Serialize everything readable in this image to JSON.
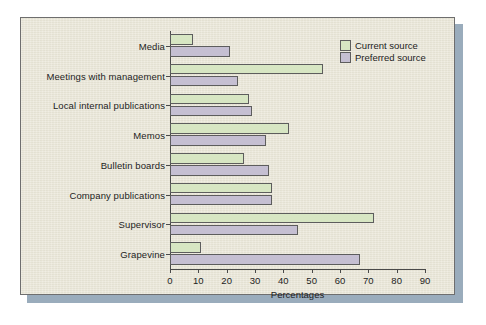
{
  "chart_data": {
    "type": "bar",
    "orientation": "horizontal",
    "title": "",
    "xlabel": "Percentages",
    "ylabel": "",
    "xlim": [
      0,
      90
    ],
    "xticks": [
      0,
      10,
      20,
      30,
      40,
      50,
      60,
      70,
      80,
      90
    ],
    "grid": false,
    "legend_position": "top-right",
    "categories": [
      "Media",
      "Meetings with management",
      "Local internal publications",
      "Memos",
      "Bulletin boards",
      "Company publications",
      "Supervisor",
      "Grapevine"
    ],
    "series": [
      {
        "name": "Current source",
        "color": "#d7e6c3",
        "values": [
          8,
          54,
          28,
          42,
          26,
          36,
          72,
          11
        ]
      },
      {
        "name": "Preferred source",
        "color": "#c5bfd2",
        "values": [
          21,
          24,
          29,
          34,
          35,
          36,
          45,
          67
        ]
      }
    ]
  },
  "legend": {
    "items": [
      {
        "label": "Current source"
      },
      {
        "label": "Preferred source"
      }
    ]
  },
  "axis": {
    "x_title": "Percentages",
    "x_tick_labels": [
      "0",
      "10",
      "20",
      "30",
      "40",
      "50",
      "60",
      "70",
      "80",
      "90"
    ]
  },
  "colors": {
    "panel_background": "#e9e6d7",
    "panel_border": "#6e6e6e",
    "shadow": "#9aacbc",
    "current_source": "#d7e6c3",
    "preferred_source": "#c5bfd2",
    "axis": "#4a4a4a",
    "text": "#1d1d1d"
  }
}
